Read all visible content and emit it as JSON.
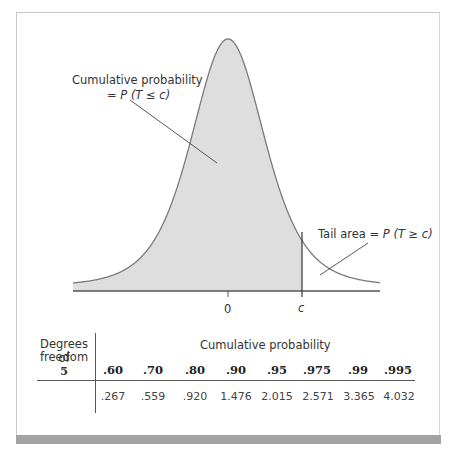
{
  "figure": {
    "annotation_cumulative": {
      "line1": "Cumulative probability",
      "line2_prefix": "= ",
      "line2_math": "P (T ≤ c)"
    },
    "annotation_tail": {
      "prefix": "Tail area = ",
      "math": "P (T ≥ c)"
    },
    "axis_ticks": {
      "zero": "0",
      "c": "c"
    },
    "colors": {
      "shaded_area": "#dedede",
      "curve": "#7a7a7a",
      "axis": "#555555",
      "frame": "#c8c8c8",
      "bottom_bar": "#a3a3a3"
    }
  },
  "table": {
    "row_header_line1": "Degrees of",
    "row_header_line2": "freedom",
    "df": "5",
    "column_group_label": "Cumulative probability",
    "columns": [
      ".60",
      ".70",
      ".80",
      ".90",
      ".95",
      ".975",
      ".99",
      ".995"
    ],
    "values": [
      ".267",
      ".559",
      ".920",
      "1.476",
      "2.015",
      "2.571",
      "3.365",
      "4.032"
    ]
  },
  "chart_data": {
    "type": "area",
    "title": "",
    "xlabel": "",
    "ylabel": "",
    "x_ticks": [
      "0",
      "c"
    ],
    "annotations": [
      "Cumulative probability = P(T ≤ c)",
      "Tail area = P(T ≥ c)"
    ],
    "grid": false,
    "table": {
      "df": 5,
      "cumulative_probability": [
        0.6,
        0.7,
        0.8,
        0.9,
        0.95,
        0.975,
        0.99,
        0.995
      ],
      "critical_value": [
        0.267,
        0.559,
        0.92,
        1.476,
        2.015,
        2.571,
        3.365,
        4.032
      ]
    }
  }
}
